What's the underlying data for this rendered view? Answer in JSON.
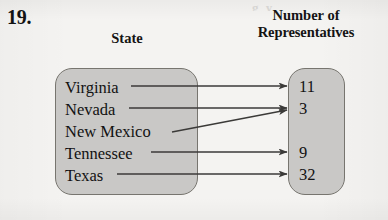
{
  "problem": {
    "number": "19."
  },
  "headers": {
    "left": "State",
    "right_line1": "Number of",
    "right_line2": "Representatives"
  },
  "bleed_text": "g y",
  "diagram": {
    "type": "mapping-diagram",
    "domain_label": "State",
    "range_label": "Number of Representatives",
    "domain": [
      {
        "label": "Virginia",
        "y": 90
      },
      {
        "label": "Nevada",
        "y": 112
      },
      {
        "label": "New Mexico",
        "y": 134
      },
      {
        "label": "Tennessee",
        "y": 156
      },
      {
        "label": "Texas",
        "y": 178
      }
    ],
    "range": [
      {
        "label": "11",
        "y": 90
      },
      {
        "label": "3",
        "y": 112
      },
      {
        "label": "9",
        "y": 156
      },
      {
        "label": "32",
        "y": 178
      }
    ],
    "mappings": [
      {
        "from": "Virginia",
        "to": "11"
      },
      {
        "from": "Nevada",
        "to": "3"
      },
      {
        "from": "New Mexico",
        "to": "3"
      },
      {
        "from": "Tennessee",
        "to": "9"
      },
      {
        "from": "Texas",
        "to": "32"
      }
    ],
    "colors": {
      "box_fill": "#c9c8c6",
      "box_border": "#77756f",
      "arrow": "#3b3a38",
      "text": "#121212",
      "paper": "#f4f3f1"
    }
  }
}
